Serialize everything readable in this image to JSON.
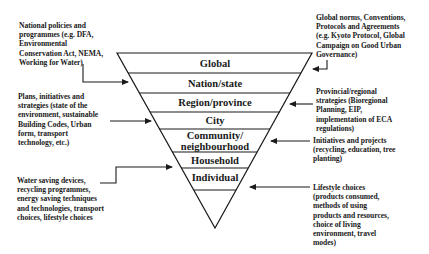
{
  "diagram": {
    "levels": [
      {
        "label": "Global"
      },
      {
        "label": "Nation/state"
      },
      {
        "label": "Region/province"
      },
      {
        "label": "City"
      },
      {
        "label": "Community/\nneighbourhood"
      },
      {
        "label": "Household"
      },
      {
        "label": "Individual"
      }
    ],
    "left_notes": [
      {
        "text": "National policies and\nprogrammes (e.g. DFA,\nEnvironmental\nConservation Act, NEMA,\nWorking for Water)",
        "target": "Nation/state"
      },
      {
        "text": "Plans, initiatives and\nstrategies (state of the\nenvironment, sustainable\nBuilding Codes, Urban\nform, transport\ntechnology, etc.)",
        "target": "City"
      },
      {
        "text": "Water saving devices,\nrecycling programmes,\nenergy saving techniques\nand technologies, transport\nchoices, lifestyle choices",
        "target": "Household"
      }
    ],
    "right_notes": [
      {
        "text": "Global norms, Conventions,\nProtocols and Agreements\n(e.g. Kyoto Protocol, Global\nCampaign on Good Urban\nGovernance)",
        "target": "Global"
      },
      {
        "text": "Provincial/regional\nstrategies (Bioregional\nPlanning, EIP,\nimplementation of ECA\nregulations)",
        "target": "Region/province"
      },
      {
        "text": "Initiatives and projects\n(recycling, education, tree\nplanting)",
        "target": "Community/neighbourhood"
      },
      {
        "text": "Lifestyle choices\n(products consumed,\nmethods of using\nproducts and resources,\nchoice of living\nenvironment, travel\nmodes)",
        "target": "Individual"
      }
    ],
    "colors": {
      "line": "#1a1a1a",
      "background": "#ffffff"
    }
  }
}
